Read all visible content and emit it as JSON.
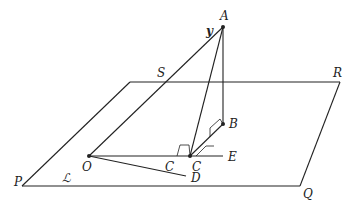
{
  "diagram": {
    "plane_labels": {
      "S": "S",
      "R": "R",
      "P": "P",
      "Q": "Q",
      "L": "ℒ"
    },
    "point_labels": {
      "A": "A",
      "y": "y",
      "B": "B",
      "O": "O",
      "E": "E",
      "D": "D",
      "C1": "C",
      "C2": "C"
    },
    "points": {
      "A": [
        223,
        27
      ],
      "B": [
        223,
        124
      ],
      "O": [
        89,
        156
      ],
      "C": [
        190,
        156
      ],
      "E_end": [
        223,
        156
      ],
      "D_end": [
        188,
        176
      ],
      "plane_S": [
        130,
        82
      ],
      "plane_R": [
        340,
        82
      ],
      "plane_Q": [
        300,
        186
      ],
      "plane_P": [
        20,
        186
      ]
    },
    "colors": {
      "stroke": "#222222",
      "background": "#ffffff"
    }
  }
}
